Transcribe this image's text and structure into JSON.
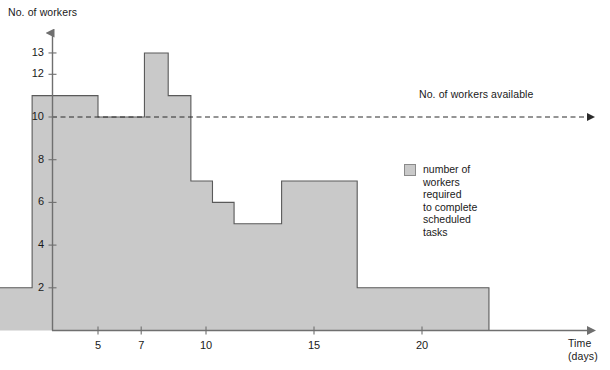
{
  "chart_data": {
    "type": "area",
    "title": "",
    "subtitle": "",
    "xlabel": "Time\n(days)",
    "ylabel": "No. of workers",
    "xlim": [
      0,
      24
    ],
    "ylim": [
      0,
      14
    ],
    "grid": false,
    "legend_position": "right",
    "series": [
      {
        "name": "number of\nworkers\nrequired\nto complete\nscheduled\ntasks",
        "style": "step-post",
        "fill_color": "#c9c9c9",
        "line_color": "#5a5a5a",
        "steps": [
          {
            "x_start": 0,
            "x_end": 1.95,
            "value": 2
          },
          {
            "x_start": 1.95,
            "x_end": 5.0,
            "value": 11
          },
          {
            "x_start": 5.0,
            "x_end": 7.15,
            "value": 10
          },
          {
            "x_start": 7.15,
            "x_end": 8.25,
            "value": 13
          },
          {
            "x_start": 8.25,
            "x_end": 9.3,
            "value": 11
          },
          {
            "x_start": 9.3,
            "x_end": 10.3,
            "value": 7
          },
          {
            "x_start": 10.3,
            "x_end": 11.3,
            "value": 6
          },
          {
            "x_start": 11.3,
            "x_end": 13.5,
            "value": 5
          },
          {
            "x_start": 13.5,
            "x_end": 17.0,
            "value": 7
          },
          {
            "x_start": 17.0,
            "x_end": 23.1,
            "value": 2
          }
        ]
      }
    ],
    "reference_lines": [
      {
        "name": "workers-available",
        "value": 10,
        "orientation": "horizontal",
        "style": "dashed",
        "label": "No. of workers available",
        "arrow": true
      }
    ],
    "y_ticks": [
      2,
      4,
      6,
      8,
      10,
      12,
      13
    ],
    "x_ticks": [
      5,
      7,
      10,
      15,
      20
    ]
  },
  "axes": {
    "y_title": "No. of workers",
    "x_title_line1": "Time",
    "x_title_line2": "(days)"
  },
  "annotation": {
    "available_label": "No. of workers available"
  },
  "legend": {
    "swatch_name": "legend-swatch",
    "text": "number of\nworkers\nrequired\nto complete\nscheduled\ntasks"
  },
  "colors": {
    "fill": "#c9c9c9",
    "outline": "#5a5a5a",
    "axis": "#6f6f6f",
    "text": "#1a1a1a"
  },
  "y_tick_labels": [
    "13",
    "12",
    "10",
    "8",
    "6",
    "4",
    "2"
  ],
  "x_tick_labels": [
    "5",
    "7",
    "10",
    "15",
    "20"
  ]
}
